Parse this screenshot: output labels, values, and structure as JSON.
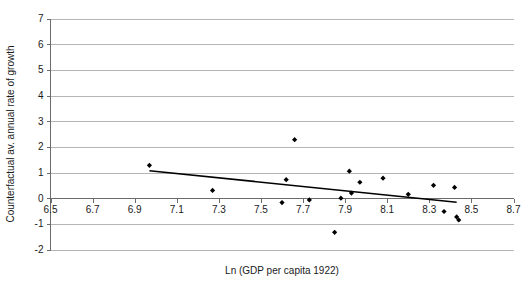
{
  "chart_data": {
    "type": "scatter",
    "title": "",
    "xlabel": "Ln (GDP per capita 1922)",
    "ylabel": "Counterfactual av. annual rate of growth",
    "xlim": [
      6.5,
      8.7
    ],
    "ylim": [
      -2,
      7
    ],
    "xticks": [
      "6.5",
      "6.7",
      "6.9",
      "7.1",
      "7.3",
      "7.5",
      "7.7",
      "7.9",
      "8.1",
      "8.3",
      "8.5",
      "8.7"
    ],
    "xtick_values": [
      6.5,
      6.7,
      6.9,
      7.1,
      7.3,
      7.5,
      7.7,
      7.9,
      8.1,
      8.3,
      8.5,
      8.7
    ],
    "yticks": [
      "-2",
      "-1",
      "0",
      "1",
      "2",
      "3",
      "4",
      "5",
      "6",
      "7"
    ],
    "ytick_values": [
      -2,
      -1,
      0,
      1,
      2,
      3,
      4,
      5,
      6,
      7
    ],
    "grid": true,
    "grid_axis": "y",
    "legend": false,
    "marker_color": "#000000",
    "gridline_color": "#b5b5b5",
    "axis_color": "#6b6b6b",
    "trendline_color": "#000000",
    "points": [
      {
        "x": 6.97,
        "y": 1.28
      },
      {
        "x": 7.27,
        "y": 0.3
      },
      {
        "x": 7.6,
        "y": -0.17
      },
      {
        "x": 7.62,
        "y": 0.72
      },
      {
        "x": 7.66,
        "y": 2.28
      },
      {
        "x": 7.73,
        "y": -0.07
      },
      {
        "x": 7.88,
        "y": 0.0
      },
      {
        "x": 7.85,
        "y": -1.33
      },
      {
        "x": 7.93,
        "y": 0.2
      },
      {
        "x": 7.92,
        "y": 1.05
      },
      {
        "x": 7.97,
        "y": 0.62
      },
      {
        "x": 8.08,
        "y": 0.78
      },
      {
        "x": 8.2,
        "y": 0.15
      },
      {
        "x": 8.32,
        "y": 0.5
      },
      {
        "x": 8.37,
        "y": -0.52
      },
      {
        "x": 8.42,
        "y": 0.42
      },
      {
        "x": 8.43,
        "y": -0.73
      },
      {
        "x": 8.44,
        "y": -0.85
      }
    ],
    "trendline": {
      "x0": 6.97,
      "y0": 1.07,
      "x1": 8.43,
      "y1": -0.16
    }
  }
}
